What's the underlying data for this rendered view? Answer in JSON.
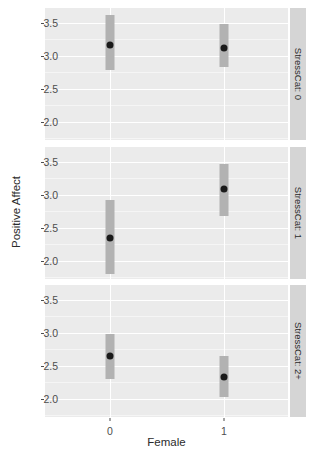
{
  "chart_data": {
    "type": "scatter",
    "title": "",
    "xlabel": "Female",
    "ylabel": "Positive Affect",
    "categories": [
      "0",
      "1"
    ],
    "yticks": [
      2.0,
      2.5,
      3.0,
      3.5
    ],
    "ytick_labels": [
      "2.0",
      "2.5",
      "3.0",
      "3.5"
    ],
    "ylim": [
      1.72,
      3.72
    ],
    "grid": true,
    "legend": "none",
    "facet_variable": "StressCat",
    "facet_position": "right",
    "marks": "point-with-errorbar",
    "panels": [
      {
        "strip_label": "StressCat: 0",
        "points": [
          {
            "x": "0",
            "estimate": 3.16,
            "lower": 2.78,
            "upper": 3.61
          },
          {
            "x": "1",
            "estimate": 3.12,
            "lower": 2.83,
            "upper": 3.48
          }
        ]
      },
      {
        "strip_label": "StressCat: 1",
        "points": [
          {
            "x": "0",
            "estimate": 2.34,
            "lower": 1.8,
            "upper": 2.91
          },
          {
            "x": "1",
            "estimate": 3.08,
            "lower": 2.67,
            "upper": 3.47
          }
        ]
      },
      {
        "strip_label": "StressCat: 2+",
        "points": [
          {
            "x": "0",
            "estimate": 2.64,
            "lower": 2.29,
            "upper": 2.98
          },
          {
            "x": "1",
            "estimate": 2.33,
            "lower": 2.02,
            "upper": 2.64
          }
        ]
      }
    ],
    "colors": {
      "panel_background": "#ebebeb",
      "grid_major": "#ffffff",
      "grid_minor": "#f5f5f5",
      "errorbar": "#b2b2b2",
      "point": "#1a1a1a",
      "strip_background": "#d5d5d5",
      "axis_text": "#4d4d4d",
      "axis_title": "#2b2b2b"
    }
  }
}
